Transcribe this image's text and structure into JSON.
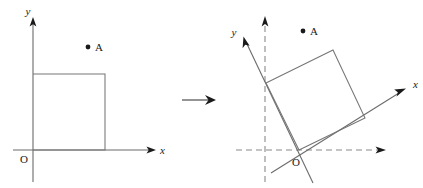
{
  "figure": {
    "type": "geometric-diagram",
    "width": 423,
    "height": 188,
    "background_color": "#ffffff",
    "stroke_color": "#6b6b6b",
    "label_color": "#1a1a1a",
    "dash_color": "#8a8a8a"
  },
  "left_panel": {
    "name": "original-coordinate-system",
    "axes": {
      "x_label": "x",
      "y_label": "y",
      "origin_label": "O"
    },
    "point": {
      "label": "A"
    },
    "square": {
      "name": "axis-aligned-square",
      "corners": [
        [
          33,
          74
        ],
        [
          105,
          74
        ],
        [
          105,
          150
        ],
        [
          33,
          150
        ]
      ]
    }
  },
  "transform": {
    "name": "transform-arrow",
    "glyph": "⟶"
  },
  "right_panel": {
    "name": "rotated-coordinate-system",
    "axes": {
      "x_label": "x",
      "y_label": "y",
      "origin_label": "O",
      "rotation_note": "axes rotated counter-clockwise",
      "dashed_reference": "original axes shown dashed"
    },
    "point": {
      "label": "A"
    },
    "square": {
      "name": "rotated-square",
      "corners": [
        [
          266,
          83
        ],
        [
          333,
          50
        ],
        [
          365,
          118
        ],
        [
          299,
          150
        ]
      ]
    }
  }
}
